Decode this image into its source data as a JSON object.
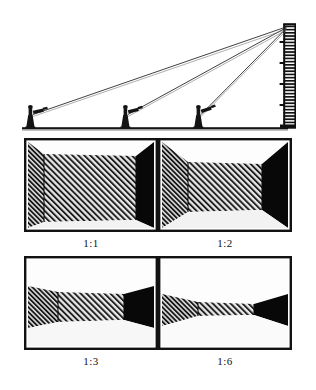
{
  "figure": {
    "background_color": "#ffffff",
    "ink_color": "#111111"
  },
  "top_diagram": {
    "name": "plan-view-of-camera-positions",
    "description": "Side elevation: three cameras on tripods at increasing distances sight toward the top of a tall hatched wall; sight lines converge at the wall top.",
    "ground_line_y": 128,
    "subject": {
      "name": "hatched-vertical-wall",
      "x": 286,
      "top_y": 24,
      "bottom_y": 128,
      "width": 12,
      "hatch": "horizontal-rung-ticks"
    },
    "convergence_point": {
      "x": 288,
      "y": 28
    },
    "cameras": [
      {
        "name": "camera-far",
        "label": "",
        "x": 30,
        "ground_y": 128,
        "ratio": "1:1"
      },
      {
        "name": "camera-mid",
        "label": "",
        "x": 125,
        "ground_y": 128,
        "ratio": "1:2"
      },
      {
        "name": "camera-near",
        "label": "",
        "x": 198,
        "ground_y": 128,
        "ratio": "1:3"
      }
    ]
  },
  "frames": [
    {
      "id": "frame-1-1",
      "label": "1:1",
      "name": "perspective-frame-1-1",
      "description": "Widest interior view: large hatched rear wall fills most of the frame, narrow side walls.",
      "rear_wall": {
        "left": 18,
        "right": 112,
        "top": 16,
        "bottom": 80
      },
      "side_wall_left_shade": "hatched",
      "side_wall_right_shade": "solid-black"
    },
    {
      "id": "frame-1-2",
      "label": "1:2",
      "name": "perspective-frame-1-2",
      "description": "Rear wall smaller, side walls broader and steeper than 1:1.",
      "rear_wall": {
        "left": 28,
        "right": 104,
        "top": 24,
        "bottom": 74
      },
      "side_wall_left_shade": "hatched",
      "side_wall_right_shade": "solid-black"
    },
    {
      "id": "frame-1-3",
      "label": "1:3",
      "name": "perspective-frame-1-3",
      "description": "Rear wall compressed into a horizontal band; side walls strongly flared.",
      "rear_wall": {
        "left": 30,
        "right": 100,
        "top": 36,
        "bottom": 68
      },
      "side_wall_left_shade": "hatched",
      "side_wall_right_shade": "solid-black"
    },
    {
      "id": "frame-1-6",
      "label": "1:6",
      "name": "perspective-frame-1-6",
      "description": "Narrowest band: rear wall nearly flat, side walls form bow-tie wedges.",
      "rear_wall": {
        "left": 36,
        "right": 96,
        "top": 44,
        "bottom": 64
      },
      "side_wall_left_shade": "hatched",
      "side_wall_right_shade": "solid-black"
    }
  ]
}
